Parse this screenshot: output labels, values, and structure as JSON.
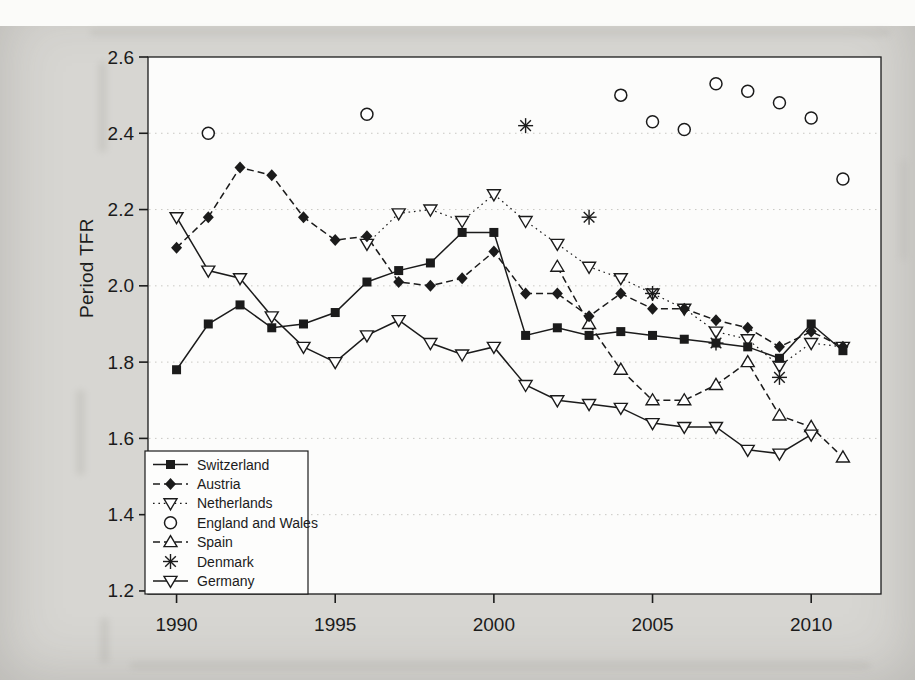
{
  "page": {
    "y_axis_title": "Period TFR"
  },
  "colors": {
    "page_background": "#d7d6d2",
    "plot_background": "#fcfcfb",
    "ink": "#1b1b1b",
    "grid": "#c9c8c3"
  },
  "chart_data": {
    "type": "line",
    "title": "",
    "xlabel": "",
    "ylabel": "Period TFR",
    "xlim": [
      1989.1,
      2012.2
    ],
    "ylim": [
      1.192,
      2.6
    ],
    "x_ticks": [
      1990,
      1995,
      2000,
      2005,
      2010
    ],
    "y_ticks": [
      1.2,
      1.4,
      1.6,
      1.8,
      2.0,
      2.2,
      2.4,
      2.6
    ],
    "grid": "faint dotted horizontal lines at y ticks",
    "legend_position": "lower left",
    "series": [
      {
        "name": "Switzerland",
        "marker": "filled-square",
        "line": "solid",
        "points": [
          [
            1990,
            1.78
          ],
          [
            1991,
            1.9
          ],
          [
            1992,
            1.95
          ],
          [
            1993,
            1.89
          ],
          [
            1994,
            1.9
          ],
          [
            1995,
            1.93
          ],
          [
            1996,
            2.01
          ],
          [
            1997,
            2.04
          ],
          [
            1998,
            2.06
          ],
          [
            1999,
            2.14
          ],
          [
            2000,
            2.14
          ],
          [
            2001,
            1.87
          ],
          [
            2002,
            1.89
          ],
          [
            2003,
            1.87
          ],
          [
            2004,
            1.88
          ],
          [
            2005,
            1.87
          ],
          [
            2006,
            1.86
          ],
          [
            2007,
            1.85
          ],
          [
            2008,
            1.84
          ],
          [
            2009,
            1.81
          ],
          [
            2010,
            1.9
          ],
          [
            2011,
            1.83
          ]
        ]
      },
      {
        "name": "Austria",
        "marker": "filled-diamond",
        "line": "dashed",
        "points": [
          [
            1990,
            2.1
          ],
          [
            1991,
            2.18
          ],
          [
            1992,
            2.31
          ],
          [
            1993,
            2.29
          ],
          [
            1994,
            2.18
          ],
          [
            1995,
            2.12
          ],
          [
            1996,
            2.13
          ],
          [
            1997,
            2.01
          ],
          [
            1998,
            2.0
          ],
          [
            1999,
            2.02
          ],
          [
            2000,
            2.09
          ],
          [
            2001,
            1.98
          ],
          [
            2002,
            1.98
          ],
          [
            2003,
            1.92
          ],
          [
            2004,
            1.98
          ],
          [
            2005,
            1.94
          ],
          [
            2006,
            1.94
          ],
          [
            2007,
            1.91
          ],
          [
            2008,
            1.89
          ],
          [
            2009,
            1.84
          ],
          [
            2010,
            1.88
          ],
          [
            2011,
            1.84
          ]
        ]
      },
      {
        "name": "Netherlands",
        "marker": "open-triangle-down",
        "line": "dotted",
        "points": [
          [
            1996,
            2.11
          ],
          [
            1997,
            2.19
          ],
          [
            1998,
            2.2
          ],
          [
            1999,
            2.17
          ],
          [
            2000,
            2.24
          ],
          [
            2001,
            2.17
          ],
          [
            2002,
            2.11
          ],
          [
            2003,
            2.05
          ],
          [
            2004,
            2.02
          ],
          [
            2005,
            1.98
          ],
          [
            2006,
            1.94
          ],
          [
            2007,
            1.88
          ],
          [
            2008,
            1.86
          ],
          [
            2009,
            1.79
          ],
          [
            2010,
            1.85
          ],
          [
            2011,
            1.84
          ]
        ]
      },
      {
        "name": "England and Wales",
        "marker": "open-circle",
        "line": "none",
        "points": [
          [
            1991,
            2.4
          ],
          [
            1996,
            2.45
          ],
          [
            2004,
            2.5
          ],
          [
            2005,
            2.43
          ],
          [
            2006,
            2.41
          ],
          [
            2007,
            2.53
          ],
          [
            2008,
            2.51
          ],
          [
            2009,
            2.48
          ],
          [
            2010,
            2.44
          ],
          [
            2011,
            2.28
          ]
        ]
      },
      {
        "name": "Spain",
        "marker": "open-triangle-up",
        "line": "dashed",
        "points": [
          [
            2002,
            2.05
          ],
          [
            2003,
            1.9
          ],
          [
            2004,
            1.78
          ],
          [
            2005,
            1.7
          ],
          [
            2006,
            1.7
          ],
          [
            2007,
            1.74
          ],
          [
            2008,
            1.8
          ],
          [
            2009,
            1.66
          ],
          [
            2010,
            1.63
          ],
          [
            2011,
            1.55
          ]
        ]
      },
      {
        "name": "Denmark",
        "marker": "asterisk",
        "line": "none",
        "points": [
          [
            2001,
            2.42
          ],
          [
            2003,
            2.18
          ],
          [
            2005,
            1.98
          ],
          [
            2007,
            1.85
          ],
          [
            2009,
            1.76
          ]
        ]
      },
      {
        "name": "Germany",
        "marker": "open-triangle-down",
        "line": "solid",
        "points": [
          [
            1990,
            2.18
          ],
          [
            1991,
            2.04
          ],
          [
            1992,
            2.02
          ],
          [
            1993,
            1.92
          ],
          [
            1994,
            1.84
          ],
          [
            1995,
            1.8
          ],
          [
            1996,
            1.87
          ],
          [
            1997,
            1.91
          ],
          [
            1998,
            1.85
          ],
          [
            1999,
            1.82
          ],
          [
            2000,
            1.84
          ],
          [
            2001,
            1.74
          ],
          [
            2002,
            1.7
          ],
          [
            2003,
            1.69
          ],
          [
            2004,
            1.68
          ],
          [
            2005,
            1.64
          ],
          [
            2006,
            1.63
          ],
          [
            2007,
            1.63
          ],
          [
            2008,
            1.57
          ],
          [
            2009,
            1.56
          ],
          [
            2010,
            1.61
          ]
        ]
      }
    ]
  }
}
